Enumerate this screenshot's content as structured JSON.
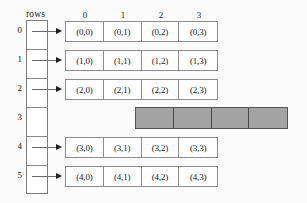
{
  "diagram": {
    "pointer_array_label": "rows",
    "column_headers": [
      "0",
      "1",
      "2",
      "3"
    ],
    "row_indices": [
      "0",
      "1",
      "2",
      "3",
      "4",
      "5"
    ],
    "rows": [
      {
        "index": "0",
        "has_pointer": true,
        "allocated": true,
        "cells": [
          "(0,0)",
          "(0,1)",
          "(0,2)",
          "(0,3)"
        ]
      },
      {
        "index": "1",
        "has_pointer": true,
        "allocated": true,
        "cells": [
          "(1,0)",
          "(1,1)",
          "(1,2)",
          "(1,3)"
        ]
      },
      {
        "index": "2",
        "has_pointer": true,
        "allocated": true,
        "cells": [
          "(2,0)",
          "(2,1)",
          "(2,2)",
          "(2,3)"
        ]
      },
      {
        "index": "3",
        "has_pointer": false,
        "allocated": false,
        "cells": [
          "",
          "",
          "",
          ""
        ]
      },
      {
        "index": "4",
        "has_pointer": true,
        "allocated": true,
        "cells": [
          "(3,0)",
          "(3,1)",
          "(3,2)",
          "(3,3)"
        ]
      },
      {
        "index": "5",
        "has_pointer": true,
        "allocated": true,
        "cells": [
          "(4,0)",
          "(4,1)",
          "(4,2)",
          "(4,3)"
        ]
      }
    ],
    "colors": {
      "background": "#fbfbfb",
      "border": "#8d8d8d",
      "text": "#1a1a1a",
      "grey_fill": "#a3a3a3",
      "grey_border": "#4a4a4a",
      "arrow": "#1f1f1f"
    }
  }
}
